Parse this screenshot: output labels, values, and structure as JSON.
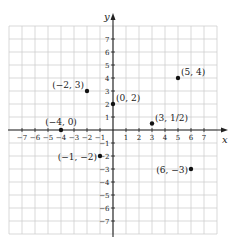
{
  "chart_data": {
    "type": "scatter",
    "title": "",
    "xlabel": "x",
    "ylabel": "y",
    "xlim": [
      -8,
      8
    ],
    "ylim": [
      -8,
      8
    ],
    "grid": true,
    "x_ticks": [
      -7,
      -6,
      -5,
      -4,
      -3,
      -2,
      -1,
      1,
      2,
      3,
      4,
      5,
      6,
      7
    ],
    "y_ticks": [
      -7,
      -6,
      -5,
      -4,
      -3,
      -2,
      -1,
      1,
      2,
      3,
      4,
      5,
      6,
      7
    ],
    "x_tick_labels": [
      "−7",
      "−6",
      "−5",
      "−4",
      "−3",
      "−2",
      "−1",
      "1",
      "2",
      "3",
      "4",
      "5",
      "6",
      "7"
    ],
    "y_tick_labels": [
      "−7",
      "−6",
      "−5",
      "−4",
      "−3",
      "−2",
      "−1",
      "1",
      "2",
      "3",
      "4",
      "5",
      "6",
      "7"
    ],
    "points": [
      {
        "x": -2,
        "y": 3,
        "label": "(−2, 3)",
        "label_pos": "upper-left"
      },
      {
        "x": 0,
        "y": 2,
        "label": "(0, 2)",
        "label_pos": "upper-right"
      },
      {
        "x": 5,
        "y": 4,
        "label": "(5, 4)",
        "label_pos": "upper-right"
      },
      {
        "x": -4,
        "y": 0,
        "label": "(−4, 0)",
        "label_pos": "above"
      },
      {
        "x": 3,
        "y": 0.5,
        "label": "(3, 1/2)",
        "label_pos": "upper-right"
      },
      {
        "x": -1,
        "y": -2,
        "label": "(−1, −2)",
        "label_pos": "lower-left"
      },
      {
        "x": 6,
        "y": -3,
        "label": "(6, −3)",
        "label_pos": "lower-left"
      }
    ]
  },
  "colors": {
    "grid": "#cfcfcf",
    "axis": "#222222",
    "point": "#111111"
  }
}
